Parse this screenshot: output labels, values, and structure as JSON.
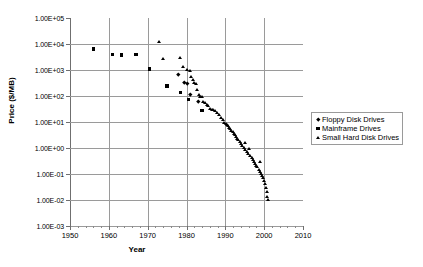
{
  "chart_data": {
    "type": "scatter",
    "title": "",
    "xlabel": "Year",
    "ylabel": "Price ($/MB)",
    "xlim": [
      1950,
      2010
    ],
    "ylim": [
      0.001,
      100000
    ],
    "yscale": "log",
    "xscale": "linear",
    "grid": true,
    "legend_position": "right",
    "xticks": [
      "1950",
      "1960",
      "1970",
      "1980",
      "1990",
      "2000",
      "2010"
    ],
    "xtick_values": [
      1950,
      1960,
      1970,
      1980,
      1990,
      2000,
      2010
    ],
    "xminor_step": 2,
    "yticks": [
      "1.00E+05",
      "1.00E+04",
      "1.00E+03",
      "1.00E+02",
      "1.00E+01",
      "1.00E+00",
      "1.00E-01",
      "1.00E-02",
      "1.00E-03"
    ],
    "ytick_values": [
      100000,
      10000,
      1000,
      100,
      10,
      1,
      0.1,
      0.01,
      0.001
    ],
    "series": [
      {
        "name": "Floppy Disk Drives",
        "marker": "diamond",
        "color": "#000000",
        "points": [
          [
            1978.0,
            700.0
          ],
          [
            1979.4,
            330.0
          ],
          [
            1980.2,
            300.0
          ],
          [
            1981.0,
            120.0
          ],
          [
            1983.0,
            60.0
          ]
        ]
      },
      {
        "name": "Mainframe Drives",
        "marker": "square",
        "color": "#000000",
        "points": [
          [
            1956.0,
            6400.0
          ],
          [
            1961.0,
            3900.0
          ],
          [
            1963.2,
            3800.0
          ],
          [
            1967.0,
            3900.0
          ],
          [
            1970.5,
            1100.0
          ],
          [
            1975.0,
            240.0
          ],
          [
            1978.5,
            140.0
          ],
          [
            1980.5,
            75.0
          ],
          [
            1984.0,
            28.0
          ]
        ]
      },
      {
        "name": "Small Hard Disk Drives",
        "marker": "triangle",
        "color": "#000000",
        "points": [
          [
            1973.0,
            12000.0
          ],
          [
            1974.0,
            2600.0
          ],
          [
            1978.4,
            2900.0
          ],
          [
            1979.2,
            1350.0
          ],
          [
            1980.3,
            1000.0
          ],
          [
            1980.9,
            900.0
          ],
          [
            1981.2,
            520.0
          ],
          [
            1981.6,
            430.0
          ],
          [
            1982.0,
            330.0
          ],
          [
            1982.4,
            300.0
          ],
          [
            1982.8,
            170.0
          ],
          [
            1983.2,
            110.0
          ],
          [
            1983.6,
            95.0
          ],
          [
            1984.0,
            90.0
          ],
          [
            1984.4,
            62.0
          ],
          [
            1984.9,
            52.0
          ],
          [
            1985.3,
            44.0
          ],
          [
            1985.7,
            42.0
          ],
          [
            1986.2,
            33.0
          ],
          [
            1986.6,
            30.0
          ],
          [
            1987.0,
            28.0
          ],
          [
            1987.4,
            26.0
          ],
          [
            1988.0,
            22.0
          ],
          [
            1988.5,
            18.0
          ],
          [
            1989.0,
            14.0
          ],
          [
            1989.4,
            12.0
          ],
          [
            1989.8,
            9.5
          ],
          [
            1990.1,
            8.5
          ],
          [
            1990.4,
            7.5
          ],
          [
            1990.7,
            6.8
          ],
          [
            1991.0,
            6.0
          ],
          [
            1991.3,
            5.2
          ],
          [
            1991.6,
            4.6
          ],
          [
            1991.9,
            4.1
          ],
          [
            1992.2,
            3.6
          ],
          [
            1992.5,
            3.1
          ],
          [
            1992.8,
            2.7
          ],
          [
            1993.1,
            2.3
          ],
          [
            1993.4,
            2.0
          ],
          [
            1993.7,
            1.7
          ],
          [
            1994.0,
            1.45
          ],
          [
            1994.4,
            1.2
          ],
          [
            1994.8,
            1.0
          ],
          [
            1995.0,
            1.6
          ],
          [
            1995.2,
            0.85
          ],
          [
            1995.6,
            0.72
          ],
          [
            1996.0,
            0.6
          ],
          [
            1996.2,
            0.95
          ],
          [
            1996.5,
            0.5
          ],
          [
            1996.9,
            0.42
          ],
          [
            1997.2,
            0.35
          ],
          [
            1997.5,
            0.29
          ],
          [
            1997.8,
            0.24
          ],
          [
            1998.0,
            0.21
          ],
          [
            1998.3,
            0.18
          ],
          [
            1998.6,
            0.15
          ],
          [
            1998.9,
            0.125
          ],
          [
            1999.0,
            0.3
          ],
          [
            1999.2,
            0.105
          ],
          [
            1999.5,
            0.088
          ],
          [
            1999.8,
            0.072
          ],
          [
            2000.0,
            0.055
          ],
          [
            2000.2,
            0.04
          ],
          [
            2000.5,
            0.028
          ],
          [
            2000.7,
            0.02
          ],
          [
            2000.9,
            0.013
          ],
          [
            2001.1,
            0.01
          ]
        ]
      }
    ]
  },
  "legend": {
    "items": [
      {
        "label": "Floppy Disk Drives",
        "marker": "diamond"
      },
      {
        "label": "Mainframe Drives",
        "marker": "square"
      },
      {
        "label": "Small Hard Disk Drives",
        "marker": "triangle"
      }
    ]
  }
}
